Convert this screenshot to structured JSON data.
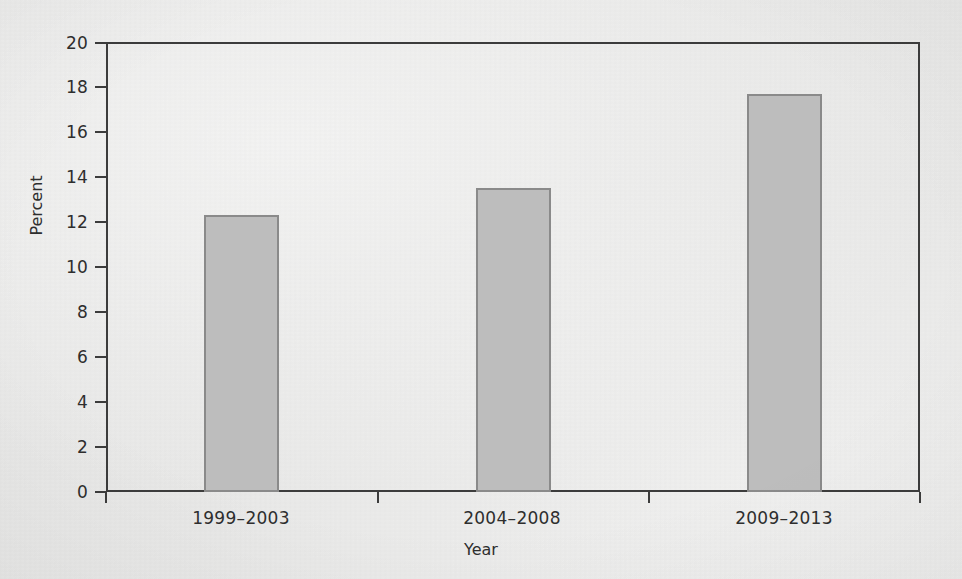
{
  "chart_data": {
    "type": "bar",
    "title": "",
    "subtitle": "",
    "categories": [
      "1999–2003",
      "2004–2008",
      "2009–2013"
    ],
    "values": [
      12.3,
      13.5,
      17.7
    ],
    "xlabel": "Year",
    "ylabel": "Percent",
    "ylim": [
      0,
      20
    ],
    "ytick_labels": [
      "0",
      "2",
      "4",
      "6",
      "8",
      "10",
      "12",
      "14",
      "16",
      "18",
      "20"
    ],
    "ytick_values": [
      0,
      2,
      4,
      6,
      8,
      10,
      12,
      14,
      16,
      18,
      20
    ],
    "grid": false,
    "legend": null,
    "annotations": [],
    "colors": {
      "bar_fill": "#bdbdbd",
      "bar_edge": "#8a8a8a",
      "axis": "#3c3c3c",
      "text": "#2e2e2e",
      "background": "#f2f2f1"
    }
  }
}
